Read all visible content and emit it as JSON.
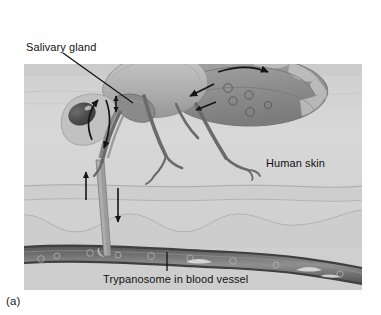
{
  "figure": {
    "panel_label": "(a)",
    "caption_note": "Tsetse fly feeding on human skin transmitting trypanosomes"
  },
  "labels": {
    "salivary_gland": "Salivary gland",
    "human_skin": "Human skin",
    "trypanosome_vessel": "Trypanosome in blood vessel"
  },
  "icons": {
    "leader_line": "leader-line-icon",
    "pointer_line": "pointer-line-icon",
    "arrow_up": "arrow-up-icon",
    "arrow_down": "arrow-down-icon",
    "arrow_curved_up": "arrow-curved-up-icon",
    "arrow_curved_down": "arrow-curved-down-icon",
    "arrow_abdomen": "arrow-abdomen-icon"
  },
  "anatomy": {
    "fly": "tsetse-fly",
    "wing": "fly-wing",
    "proboscis": "fly-proboscis",
    "eye": "fly-eye",
    "abdomen": "fly-abdomen",
    "salivary_gland": "salivary-gland",
    "legs_count": 6,
    "trypanosome_circles_in_fly": 5,
    "trypanosome_circles_in_vessel": 9
  },
  "skin": {
    "epidermis": "epidermis-layer",
    "dermis": "dermis-layer",
    "blood_vessel": "blood-vessel"
  },
  "colors": {
    "page_background": "#ffffff",
    "skin_light": "#d6d6d6",
    "skin_mid": "#c4c4c4",
    "skin_band": "#cfcfcf",
    "dermis": "#cbcbcb",
    "vessel_wall": "#5e5e5e",
    "vessel_lumen": "#8b8b8b",
    "fly_body": "#9a9a9a",
    "fly_dark": "#6b6b6b",
    "fly_light": "#c2c2c2",
    "wing": "#bdbdbd",
    "eye": "#4a4a4a",
    "text": "#111111",
    "arrow": "#1a1a1a"
  }
}
